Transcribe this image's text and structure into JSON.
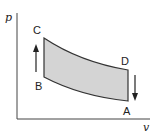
{
  "diagram": {
    "axes": {
      "y_label": "p",
      "x_label": "v"
    },
    "points": {
      "A": "A",
      "B": "B",
      "C": "C",
      "D": "D"
    },
    "colors": {
      "fill": "#d4d4d4",
      "stroke": "#333333",
      "axis": "#444444"
    },
    "arrows": [
      {
        "from": "B",
        "to": "C",
        "direction": "up"
      },
      {
        "from": "D",
        "to": "A",
        "direction": "down"
      }
    ]
  }
}
